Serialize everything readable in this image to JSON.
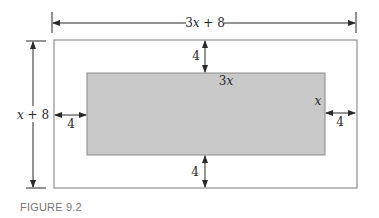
{
  "figure": {
    "caption": "FIGURE 9.2",
    "outer_width_label": {
      "coef": "3",
      "var": "x",
      "rest": " + 8"
    },
    "outer_height_label": {
      "var": "x",
      "rest": " + 8"
    },
    "inner_width_label": {
      "coef": "3",
      "var": "x"
    },
    "inner_height_label": {
      "var": "x"
    },
    "margin_top": "4",
    "margin_bottom": "4",
    "margin_left": "4",
    "margin_right": "4",
    "colors": {
      "inner_fill": "#c9c9c9",
      "outer_stroke": "#7a7a7a",
      "line": "#2a2a2a"
    }
  }
}
